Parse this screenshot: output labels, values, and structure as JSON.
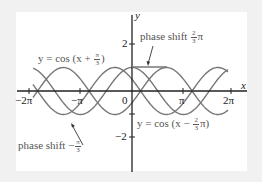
{
  "chart_data": {
    "type": "line",
    "title": "",
    "xlabel": "x",
    "ylabel": "y",
    "xlim": [
      -6.6,
      7.1
    ],
    "ylim": [
      -2.2,
      3.3
    ],
    "x_ticks": [
      "-2π",
      "-π",
      "0",
      "π",
      "2π"
    ],
    "y_ticks": [
      "2",
      "-2"
    ],
    "grid": false,
    "series": [
      {
        "name": "y = cos(x + π/3)",
        "function": "cos(x + pi/3)",
        "phase_shift": "-π/3"
      },
      {
        "name": "y = cos x",
        "function": "cos(x)",
        "phase_shift": "0"
      },
      {
        "name": "y = cos(x − 2π/3)",
        "function": "cos(x - 2*pi/3)",
        "phase_shift": "2π/3"
      }
    ],
    "annotations": [
      {
        "text": "phase shift 2/3 π",
        "points_to": [
          1.05,
          1
        ]
      },
      {
        "text": "phase shift −π/3",
        "points_to": [
          -2.09,
          -0.5
        ]
      }
    ],
    "line_color": "#777777"
  },
  "labels": {
    "axis_x": "x",
    "axis_y": "y",
    "tick_neg2pi": "−2π",
    "tick_negpi": "−π",
    "tick_zero": "0",
    "tick_pi": "π",
    "tick_2pi": "2π",
    "tick_y2": "2",
    "tick_yneg2": "−2",
    "eq_left_prefix": "y = cos (x + ",
    "eq_left_num": "π",
    "eq_left_den": "3",
    "eq_left_suffix": ")",
    "eq_right_prefix": "y = cos (x − ",
    "eq_right_num": "2",
    "eq_right_den": "3",
    "eq_right_suffix": "π)",
    "phase_top_prefix": "phase shift ",
    "phase_top_num": "2",
    "phase_top_den": "3",
    "phase_top_suffix": "π",
    "phase_bottom_prefix": "phase shift −",
    "phase_bottom_num": "π",
    "phase_bottom_den": "3"
  }
}
